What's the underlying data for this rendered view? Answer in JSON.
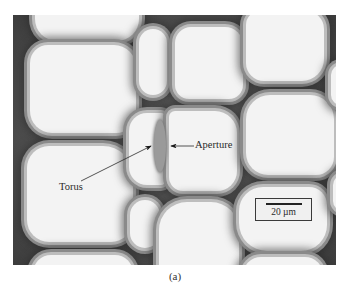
{
  "figure": {
    "labels": {
      "torus": "Torus",
      "aperture": "Aperture"
    },
    "scale_bar": {
      "text": "20 µm"
    },
    "caption": "(a)"
  },
  "colors": {
    "cell_lumen": "#f3f3f3",
    "cell_wall": "#4a4a4a",
    "torus": "#9a9a9a",
    "text": "#2a2a2a"
  }
}
